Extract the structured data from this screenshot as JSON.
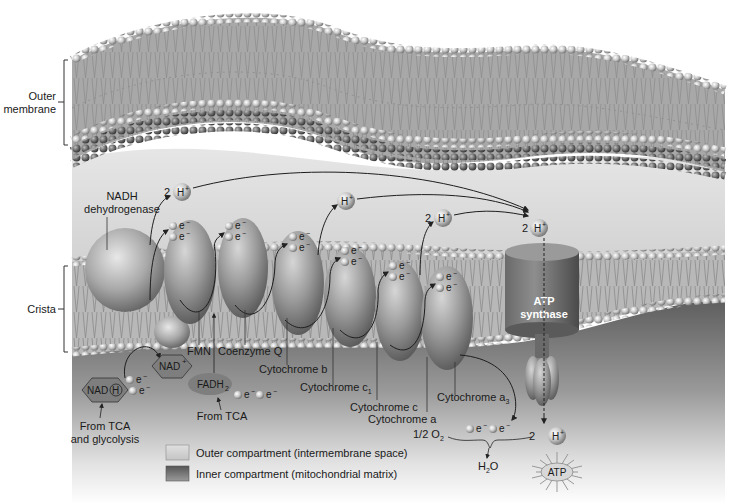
{
  "brackets": {
    "outer_membrane": "Outer\nmembrane",
    "outer_membrane_line1": "Outer",
    "outer_membrane_line2": "membrane",
    "crista": "Crista"
  },
  "complexes": {
    "nadh_dehydrogenase_line1": "NADH",
    "nadh_dehydrogenase_line2": "dehydrogenase",
    "fmn": "FMN",
    "coenzyme_q": "Coenzyme Q",
    "cytochrome_b": "Cytochrome b",
    "cytochrome_c1": "Cytochrome c",
    "cytochrome_c1_sub": "1",
    "cytochrome_c": "Cytochrome c",
    "cytochrome_a": "Cytochrome a",
    "cytochrome_a3": "Cytochrome a",
    "cytochrome_a3_sub": "3",
    "atp_synthase_line1": "ATP",
    "atp_synthase_line2": "synthase"
  },
  "molecules": {
    "nadh": "NAD",
    "nadh_h": "H",
    "nad_plus": "NAD",
    "nad_plus_sup": "+",
    "fadh2": "FADH",
    "fadh2_sub": "2",
    "electron": "e",
    "electron_sup": "−",
    "proton": "H",
    "proton_sup": "+",
    "two": "2",
    "half_o2": "1/2 O",
    "o2_sub": "2",
    "water_h": "H",
    "water_sub": "2",
    "water_o": "O",
    "atp": "ATP"
  },
  "sources": {
    "from_tca_glycolysis_line1": "From TCA",
    "from_tca_glycolysis_line2": "and glycolysis",
    "from_tca": "From TCA"
  },
  "legend": {
    "items": [
      {
        "label": "Outer compartment (intermembrane space)",
        "color": "#d4d4d4"
      },
      {
        "label": "Inner compartment (mitochondrial matrix)",
        "color": "#7a7a7a"
      }
    ]
  },
  "colors": {
    "intermembrane": "#d9d9d9",
    "matrix": "#6e6e6e",
    "lipid_head": "#c8c8c8",
    "protein": "#8f8f8f"
  }
}
